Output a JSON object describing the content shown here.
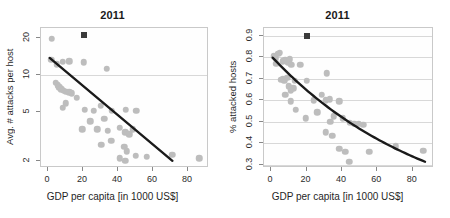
{
  "figure": {
    "width": 450,
    "height": 218,
    "background": "#ffffff",
    "panel_count": 2
  },
  "style": {
    "dot_color": "#bdbdbd",
    "marker_color": "#3b3b3b",
    "fit_line_color": "#1a1a1a",
    "grid_color": "#d8d8d8",
    "frame_color": "#c9c9c9",
    "text_color": "#1f1f1f"
  },
  "chart_data": [
    {
      "type": "scatter",
      "panel": "left",
      "title": "2011",
      "xlabel": "GDP per capita [in 1000 US$]",
      "ylabel": "Avg. # attacks per host",
      "xlim": [
        -4,
        92
      ],
      "ylim": [
        1.75,
        24
      ],
      "yscale": "log",
      "xscale": "linear",
      "xticks": [
        0,
        20,
        40,
        60,
        80
      ],
      "xticklabels": [
        "0",
        "20",
        "40",
        "60",
        "80"
      ],
      "yticks": [
        2,
        5,
        10,
        20
      ],
      "yticklabels": [
        "2",
        "5",
        "10",
        "20"
      ],
      "grid": "horizontal",
      "gridlines_y": [
        10
      ],
      "legend": "none",
      "points": [
        [
          2.0,
          19.6
        ],
        [
          1.8,
          13.2
        ],
        [
          5.0,
          12.2
        ],
        [
          8.5,
          12.8
        ],
        [
          12.0,
          12.9
        ],
        [
          20.5,
          12.6
        ],
        [
          33.5,
          11.2
        ],
        [
          4.5,
          8.6
        ],
        [
          5.5,
          8.2
        ],
        [
          6.5,
          7.9
        ],
        [
          7.5,
          7.6
        ],
        [
          9.0,
          7.4
        ],
        [
          10.5,
          7.3
        ],
        [
          12.0,
          7.2
        ],
        [
          13.5,
          7.1
        ],
        [
          10.0,
          5.9
        ],
        [
          16.5,
          6.5
        ],
        [
          8.5,
          5.4
        ],
        [
          21.0,
          5.2
        ],
        [
          26.0,
          5.1
        ],
        [
          30.0,
          5.6
        ],
        [
          36.5,
          5.1
        ],
        [
          44.5,
          5.2
        ],
        [
          50.5,
          5.1
        ],
        [
          24.0,
          4.2
        ],
        [
          32.0,
          4.4
        ],
        [
          19.5,
          3.6
        ],
        [
          28.0,
          3.6
        ],
        [
          34.0,
          3.5
        ],
        [
          41.0,
          3.7
        ],
        [
          44.0,
          3.4
        ],
        [
          46.5,
          3.3
        ],
        [
          48.5,
          3.6
        ],
        [
          30.5,
          2.7
        ],
        [
          36.0,
          2.9
        ],
        [
          43.5,
          2.6
        ],
        [
          45.0,
          2.4
        ],
        [
          41.0,
          2.1
        ],
        [
          44.0,
          2.0
        ],
        [
          50.0,
          2.2
        ],
        [
          56.5,
          2.15
        ],
        [
          71.0,
          2.25
        ],
        [
          86.5,
          2.1
        ]
      ],
      "highlight_marker": {
        "x": 20.5,
        "y": 21.0,
        "shape": "square",
        "color": "#3b3b3b"
      },
      "fit_line": {
        "type": "linear-on-log",
        "x_start": 1.0,
        "y_start": 13.6,
        "x_end": 72.0,
        "y_end": 1.93
      }
    },
    {
      "type": "scatter",
      "panel": "right",
      "title": "2011",
      "xlabel": "GDP per capita [in 1000 US$]",
      "ylabel": "% attacked hosts",
      "xlim": [
        -4,
        92
      ],
      "ylim": [
        0.285,
        0.935
      ],
      "yscale": "linear",
      "xscale": "linear",
      "xticks": [
        0,
        20,
        40,
        60,
        80
      ],
      "xticklabels": [
        "0",
        "20",
        "40",
        "60",
        "80"
      ],
      "yticks": [
        0.3,
        0.4,
        0.5,
        0.6,
        0.7,
        0.8,
        0.9
      ],
      "yticklabels": [
        "0.3",
        "0.4",
        "0.5",
        "0.6",
        "0.7",
        "0.8",
        "0.9"
      ],
      "grid": "horizontal",
      "gridlines_y": [
        0.3,
        0.4,
        0.5,
        0.6,
        0.7,
        0.8,
        0.9
      ],
      "legend": "none",
      "points": [
        [
          1.5,
          0.805
        ],
        [
          2.5,
          0.795
        ],
        [
          4.0,
          0.815
        ],
        [
          5.0,
          0.82
        ],
        [
          3.0,
          0.77
        ],
        [
          6.5,
          0.78
        ],
        [
          8.0,
          0.785
        ],
        [
          9.5,
          0.775
        ],
        [
          10.5,
          0.79
        ],
        [
          11.5,
          0.765
        ],
        [
          5.5,
          0.695
        ],
        [
          6.5,
          0.7
        ],
        [
          7.5,
          0.69
        ],
        [
          9.0,
          0.705
        ],
        [
          10.0,
          0.665
        ],
        [
          11.0,
          0.645
        ],
        [
          12.5,
          0.655
        ],
        [
          13.5,
          0.69
        ],
        [
          16.5,
          0.765
        ],
        [
          8.0,
          0.625
        ],
        [
          11.0,
          0.595
        ],
        [
          20.0,
          0.69
        ],
        [
          31.5,
          0.725
        ],
        [
          19.5,
          0.515
        ],
        [
          26.0,
          0.545
        ],
        [
          28.5,
          0.625
        ],
        [
          31.0,
          0.6
        ],
        [
          33.0,
          0.605
        ],
        [
          38.5,
          0.595
        ],
        [
          24.0,
          0.6
        ],
        [
          14.0,
          0.555
        ],
        [
          33.5,
          0.5
        ],
        [
          35.5,
          0.525
        ],
        [
          40.5,
          0.515
        ],
        [
          44.5,
          0.495
        ],
        [
          47.0,
          0.49
        ],
        [
          49.5,
          0.49
        ],
        [
          52.0,
          0.485
        ],
        [
          31.0,
          0.45
        ],
        [
          34.5,
          0.435
        ],
        [
          38.5,
          0.375
        ],
        [
          42.0,
          0.36
        ],
        [
          44.0,
          0.315
        ],
        [
          55.5,
          0.36
        ],
        [
          70.5,
          0.385
        ],
        [
          86.0,
          0.365
        ]
      ],
      "highlight_marker": {
        "x": 20.0,
        "y": 0.9,
        "shape": "square",
        "color": "#3b3b3b"
      },
      "fit_line": {
        "type": "curve",
        "x_start": 1.0,
        "y_start": 0.795,
        "x_end": 88.0,
        "y_end": 0.305
      }
    }
  ]
}
